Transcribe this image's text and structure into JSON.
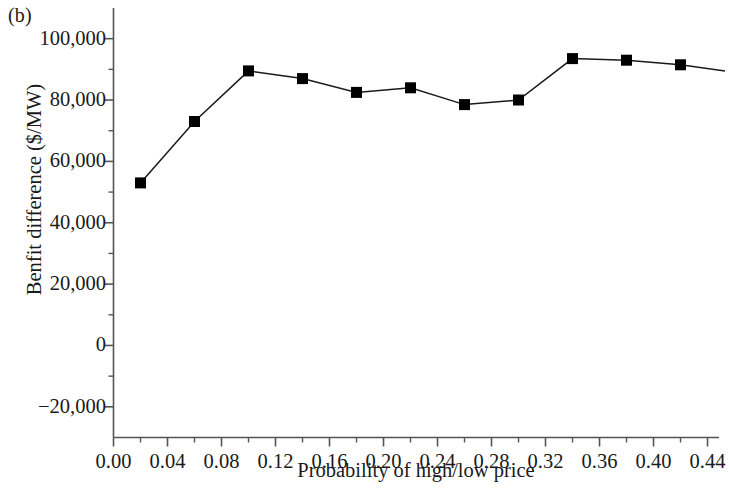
{
  "figure": {
    "panel_label": "(b)",
    "xlabel": "Probability of high/low price",
    "ylabel": "Benfit difference ($/MW)"
  },
  "chart_data": {
    "type": "line",
    "title": "",
    "subtitle": "",
    "panel": "(b)",
    "xlabel": "Probability of high/low price",
    "ylabel": "Benfit difference ($/MW)",
    "x": [
      0.02,
      0.06,
      0.1,
      0.14,
      0.18,
      0.22,
      0.26,
      0.3,
      0.34,
      0.38,
      0.42,
      0.46
    ],
    "values": [
      53000,
      73000,
      89500,
      87000,
      82500,
      84000,
      78500,
      80000,
      93500,
      93000,
      91500,
      89000
    ],
    "series": [
      {
        "name": "Benfit difference",
        "marker": "filled-square",
        "color": "#000000",
        "values": [
          53000,
          73000,
          89500,
          87000,
          82500,
          84000,
          78500,
          80000,
          93500,
          93000,
          91500,
          89000
        ]
      }
    ],
    "xlim": [
      0.0,
      0.4485
    ],
    "ylim": [
      -30000,
      110000
    ],
    "xticks": [
      0.0,
      0.04,
      0.08,
      0.12,
      0.16,
      0.2,
      0.24,
      0.28,
      0.32,
      0.36,
      0.4,
      0.44
    ],
    "xtick_labels": [
      "0.00",
      "0.04",
      "0.08",
      "0.12",
      "0.16",
      "0.20",
      "0.24",
      "0.28",
      "0.32",
      "0.36",
      "0.40",
      "0.44"
    ],
    "x_minor_step": 0.02,
    "yticks": [
      100000,
      80000,
      60000,
      40000,
      20000,
      0,
      -20000
    ],
    "ytick_labels": [
      "100,000",
      "80,000",
      "60,000",
      "40,000",
      "20,000",
      "0",
      "−20,000"
    ],
    "y_minor_step": 10000,
    "grid": false,
    "legend": null,
    "spines": [
      "left",
      "bottom"
    ],
    "tick_direction": "out"
  },
  "style": {
    "line_color": "#1a1a1a",
    "marker_color": "#111111",
    "axis_color": "#555555",
    "background": "#ffffff"
  }
}
